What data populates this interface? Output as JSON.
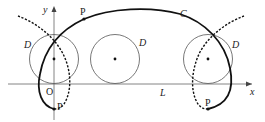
{
  "diagram": {
    "axes": {
      "x_label": "x",
      "y_label": "y",
      "origin_label": "O"
    },
    "line_label": "L",
    "curve_label": "C",
    "circle_label": "D",
    "point_label": "P",
    "circles": [
      {
        "name": "left",
        "label": "D"
      },
      {
        "name": "middle",
        "label": "D"
      },
      {
        "name": "right",
        "label": "D"
      }
    ],
    "points": [
      {
        "name": "top",
        "label": "P"
      },
      {
        "name": "bottom-left",
        "label": "P"
      },
      {
        "name": "bottom-right",
        "label": "P"
      }
    ],
    "colors": {
      "stroke": "#111111",
      "axis": "#555555",
      "circle": "#444444"
    }
  }
}
